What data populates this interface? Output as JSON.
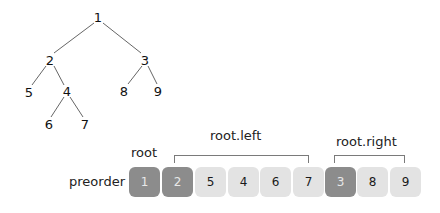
{
  "tree": {
    "nodes": [
      {
        "id": "1",
        "label": "1",
        "x": 98,
        "y": 17
      },
      {
        "id": "2",
        "label": "2",
        "x": 50,
        "y": 60
      },
      {
        "id": "3",
        "label": "3",
        "x": 145,
        "y": 60
      },
      {
        "id": "5",
        "label": "5",
        "x": 29,
        "y": 92
      },
      {
        "id": "4",
        "label": "4",
        "x": 67,
        "y": 91
      },
      {
        "id": "8",
        "label": "8",
        "x": 124,
        "y": 91
      },
      {
        "id": "9",
        "label": "9",
        "x": 158,
        "y": 91
      },
      {
        "id": "6",
        "label": "6",
        "x": 49,
        "y": 124
      },
      {
        "id": "7",
        "label": "7",
        "x": 85,
        "y": 124
      }
    ],
    "edges": [
      [
        "1",
        "2"
      ],
      [
        "1",
        "3"
      ],
      [
        "2",
        "5"
      ],
      [
        "2",
        "4"
      ],
      [
        "3",
        "8"
      ],
      [
        "3",
        "9"
      ],
      [
        "4",
        "6"
      ],
      [
        "4",
        "7"
      ]
    ]
  },
  "array": {
    "label": "preorder",
    "cells": [
      {
        "value": "1",
        "style": "dark"
      },
      {
        "value": "2",
        "style": "dark"
      },
      {
        "value": "5",
        "style": "light"
      },
      {
        "value": "4",
        "style": "light"
      },
      {
        "value": "6",
        "style": "light"
      },
      {
        "value": "7",
        "style": "light"
      },
      {
        "value": "3",
        "style": "dark"
      },
      {
        "value": "8",
        "style": "light"
      },
      {
        "value": "9",
        "style": "light"
      }
    ]
  },
  "annotations": {
    "root": "root",
    "root_left": "root.left",
    "root_right": "root.right"
  },
  "colors": {
    "dark_cell": "#8c8c8c",
    "light_cell": "#e3e3e3",
    "line": "#7a7a7a"
  }
}
